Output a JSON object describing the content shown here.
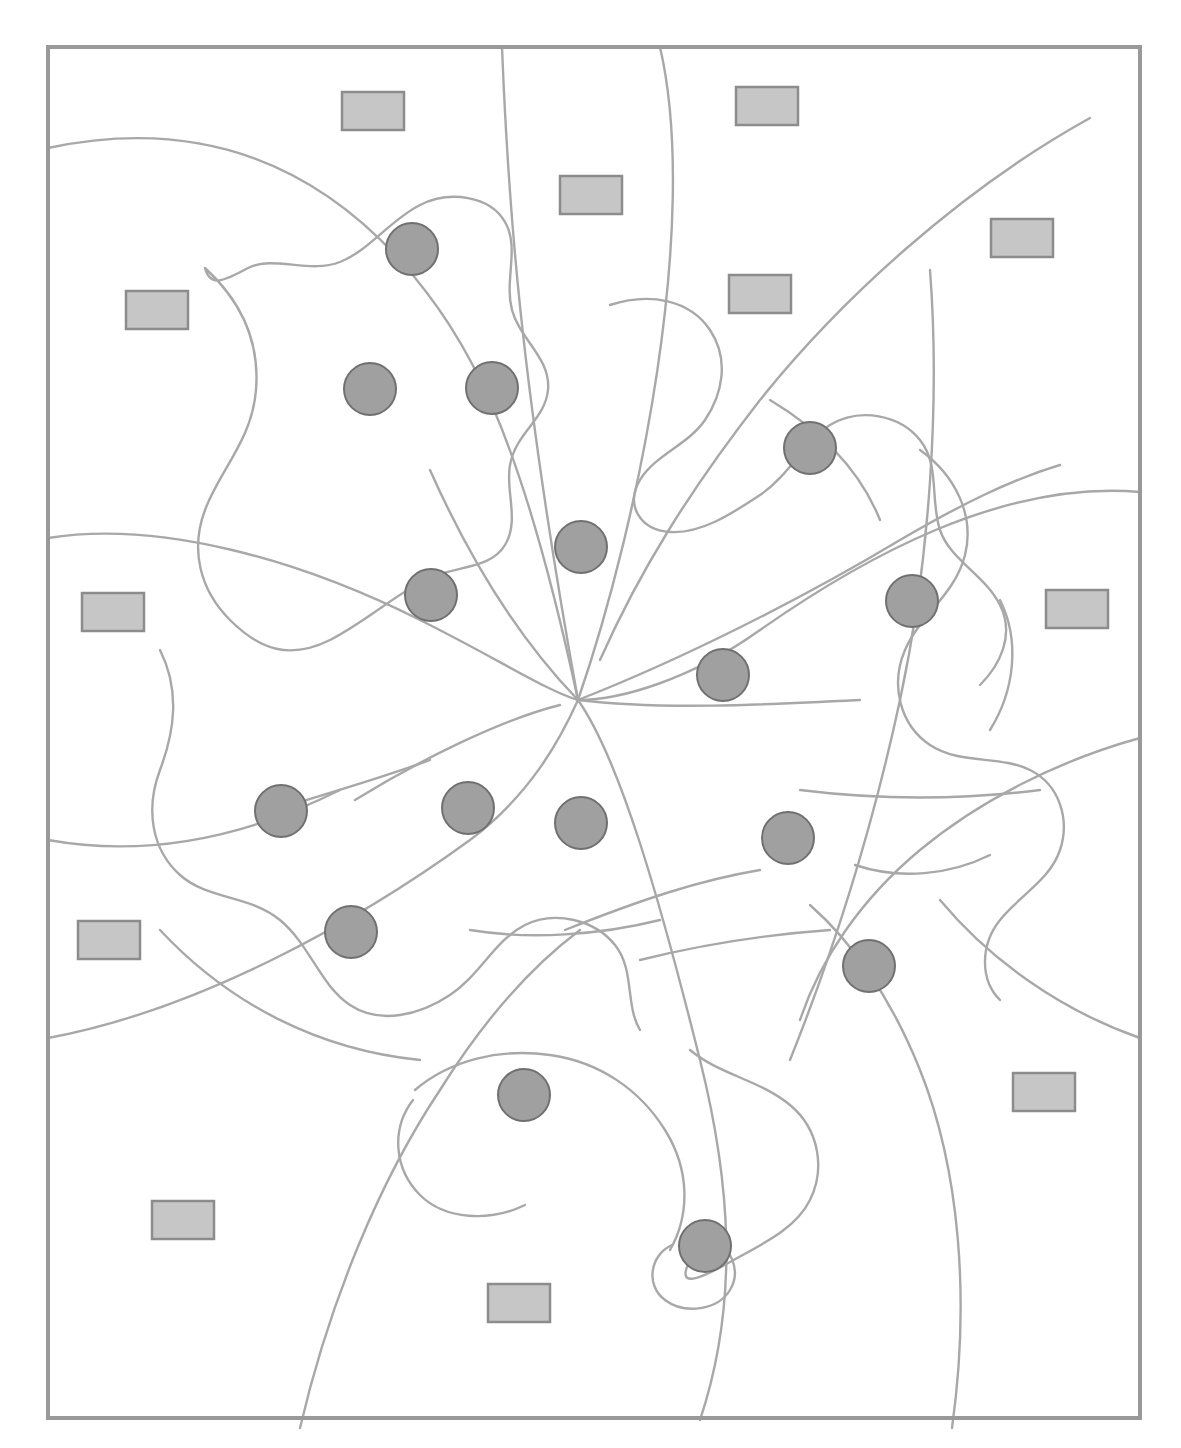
{
  "figure": {
    "background_color": "#ffffff",
    "frame": {
      "name": "outer-border",
      "x": 48,
      "y": 47,
      "width": 1092,
      "height": 1371,
      "stroke": "#999999",
      "stroke_width": 4,
      "fill": "none"
    },
    "line_art": {
      "stroke": "#a8a8a8",
      "stroke_width": 2.4,
      "description": "curving organic contour lines forming a multi-lobed leaf silhouette with radiating veins converging near the center",
      "vein_convergence_point": {
        "x": 580,
        "y": 700
      },
      "paths": [
        "M 48 148 C 180 120 300 150 400 260 C 470 340 520 430 578 700",
        "M 502 47 C 508 200 520 380 578 700",
        "M 660 47 C 700 220 640 520 578 700",
        "M 1140 492 C 1000 480 860 560 760 630 C 690 680 620 700 578 700",
        "M 48 1038 C 200 1010 360 920 470 840 C 530 795 560 740 578 700",
        "M 48 538 C 160 520 300 560 420 620 C 500 660 545 690 578 700",
        "M 578 700 C 620 760 660 900 700 1060 C 730 1180 740 1300 700 1420",
        "M 578 700 C 660 710 760 705 860 700",
        "M 578 700 C 680 660 800 600 900 540 C 960 505 1010 480 1060 465",
        "M 578 700 C 520 640 470 560 430 470",
        "M 355 800 C 420 760 500 720 560 705",
        "M 565 930 C 640 900 700 880 760 870",
        "M 640 960 C 700 945 760 935 830 930",
        "M 800 790 C 880 800 960 800 1040 790",
        "M 1090 118 C 960 190 840 300 760 400 C 690 490 640 570 600 660",
        "M 930 270 C 940 400 930 560 900 700 C 870 840 830 960 790 1060",
        "M 1140 738 C 1060 760 980 800 920 850 C 860 900 820 960 800 1020",
        "M 300 1428 C 330 1300 380 1180 440 1090 C 490 1010 540 960 580 930",
        "M 952 1428 C 970 1300 960 1170 920 1070 C 890 995 850 940 810 905",
        "M 205 268 C 240 300 260 340 256 390 C 252 440 220 470 205 510 C 190 550 200 590 230 620 C 260 650 290 660 330 640 C 365 622 395 595 425 580 C 455 565 490 570 505 545 C 520 520 505 490 510 465 C 516 432 545 420 548 390 C 551 358 520 340 512 310 C 504 280 520 248 505 222 C 490 196 450 190 420 205 C 390 220 370 250 340 262 C 310 274 272 255 248 268 C 224 281 210 288 205 268 Z",
        "M 610 305 C 650 292 690 300 710 330 C 730 360 722 395 705 420 C 688 445 655 455 640 480 C 625 505 640 530 670 532 C 700 534 730 515 760 495 C 790 475 805 440 830 425 C 860 407 900 415 920 440 C 940 465 930 500 940 530 C 950 560 985 575 1000 605 C 1015 635 1000 665 980 685",
        "M 160 650 C 180 690 175 730 160 770 C 145 810 152 850 180 875 C 208 900 250 895 280 920 C 310 945 320 985 350 1005 C 380 1025 420 1015 450 995 C 480 975 495 940 525 925 C 555 910 595 920 615 945 C 635 970 625 1005 640 1030",
        "M 920 450 C 955 475 975 515 965 555 C 955 595 920 615 905 650 C 890 685 900 725 930 745 C 960 765 1000 755 1030 770 C 1060 785 1070 820 1060 850 C 1050 880 1020 895 1000 920 C 980 945 980 980 1000 1000",
        "M 690 1050 C 720 1075 760 1080 790 1105 C 820 1130 825 1170 810 1200 C 795 1230 760 1245 730 1262 C 700 1279 675 1290 690 1260",
        "M 672 1245 C 650 1255 645 1285 665 1300 C 685 1315 718 1310 730 1290 C 742 1270 730 1245 710 1238",
        "M 415 1090 C 450 1060 500 1048 550 1055 C 600 1062 640 1090 665 1130 C 690 1170 690 1215 670 1250",
        "M 413 1100 C 390 1130 395 1170 420 1195 C 445 1220 490 1222 525 1205",
        "M 1140 1038 C 1060 1010 990 960 940 900",
        "M 48 840 C 160 860 260 830 340 790",
        "M 160 930 C 230 1005 320 1050 420 1060",
        "M 770 400 C 820 430 860 470 880 520",
        "M 1000 600 C 1020 640 1015 690 990 730",
        "M 855 865 C 900 880 950 875 990 855",
        "M 470 930 C 530 940 600 935 660 920",
        "M 290 805 C 340 790 390 775 430 760"
      ]
    },
    "circles": {
      "name": "gray-circle-marker",
      "count": 16,
      "fill": "#a0a0a0",
      "stroke": "#707070",
      "stroke_width": 2,
      "radius": 26,
      "items": [
        {
          "id": 1,
          "cx": 412,
          "cy": 249
        },
        {
          "id": 2,
          "cx": 370,
          "cy": 389
        },
        {
          "id": 3,
          "cx": 492,
          "cy": 388
        },
        {
          "id": 4,
          "cx": 810,
          "cy": 448
        },
        {
          "id": 5,
          "cx": 581,
          "cy": 547
        },
        {
          "id": 6,
          "cx": 431,
          "cy": 595
        },
        {
          "id": 7,
          "cx": 912,
          "cy": 601
        },
        {
          "id": 8,
          "cx": 723,
          "cy": 675
        },
        {
          "id": 9,
          "cx": 281,
          "cy": 811
        },
        {
          "id": 10,
          "cx": 468,
          "cy": 808
        },
        {
          "id": 11,
          "cx": 581,
          "cy": 823
        },
        {
          "id": 12,
          "cx": 788,
          "cy": 838
        },
        {
          "id": 13,
          "cx": 351,
          "cy": 932
        },
        {
          "id": 14,
          "cx": 869,
          "cy": 966
        },
        {
          "id": 15,
          "cx": 524,
          "cy": 1095
        },
        {
          "id": 16,
          "cx": 705,
          "cy": 1246
        }
      ]
    },
    "rectangles": {
      "name": "gray-rectangle-marker",
      "count": 14,
      "fill": "#c6c6c6",
      "stroke": "#8c8c8c",
      "stroke_width": 2.5,
      "width": 62,
      "height": 38,
      "items": [
        {
          "id": 1,
          "x": 342,
          "y": 92
        },
        {
          "id": 2,
          "x": 736,
          "y": 87
        },
        {
          "id": 3,
          "x": 560,
          "y": 176
        },
        {
          "id": 4,
          "x": 991,
          "y": 219
        },
        {
          "id": 5,
          "x": 729,
          "y": 275
        },
        {
          "id": 6,
          "x": 126,
          "y": 291
        },
        {
          "id": 7,
          "x": 82,
          "y": 593
        },
        {
          "id": 8,
          "x": 1046,
          "y": 590
        },
        {
          "id": 9,
          "x": 78,
          "y": 921
        },
        {
          "id": 10,
          "x": 1013,
          "y": 1073
        },
        {
          "id": 11,
          "x": 152,
          "y": 1201
        },
        {
          "id": 12,
          "x": 488,
          "y": 1284
        }
      ]
    }
  },
  "chart_data": {
    "type": "scatter",
    "xlabel": "",
    "ylabel": "",
    "xlim": [
      0,
      1181
    ],
    "ylim": [
      0,
      1448
    ],
    "grid": false,
    "legend_position": "none",
    "series": [
      {
        "name": "gray circles",
        "marker": "circle",
        "color": "#a0a0a0",
        "edge_color": "#707070",
        "count": 16,
        "x": [
          412,
          370,
          492,
          810,
          581,
          431,
          912,
          723,
          281,
          468,
          581,
          788,
          351,
          869,
          524,
          705
        ],
        "y": [
          249,
          389,
          388,
          448,
          547,
          595,
          601,
          675,
          811,
          808,
          823,
          838,
          932,
          966,
          1095,
          1246
        ]
      },
      {
        "name": "gray rectangles",
        "marker": "rectangle",
        "color": "#c6c6c6",
        "edge_color": "#8c8c8c",
        "count": 14,
        "x": [
          373,
          767,
          591,
          1022,
          760,
          157,
          113,
          1077,
          109,
          1044,
          183,
          519,
          1061,
          102
        ],
        "y": [
          111,
          106,
          195,
          238,
          294,
          310,
          612,
          609,
          940,
          1092,
          1220,
          1303,
          238,
          612
        ]
      }
    ]
  }
}
